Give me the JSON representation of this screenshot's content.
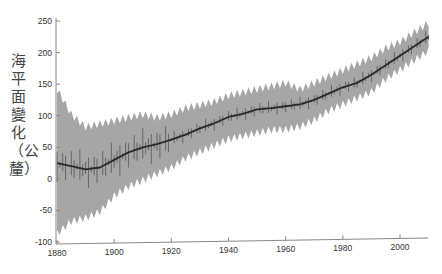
{
  "chart_data": {
    "type": "area",
    "title": "",
    "xlabel": "",
    "ylabel": "海平面變化（公釐）",
    "xlim": [
      1880,
      2012
    ],
    "ylim": [
      -100,
      250
    ],
    "xticks": [
      1880,
      1900,
      1920,
      1940,
      1960,
      1980,
      2000
    ],
    "yticks": [
      -100,
      -50,
      0,
      50,
      100,
      150,
      200,
      250
    ],
    "grid": false,
    "legend": null,
    "x": [
      1880,
      1885,
      1890,
      1895,
      1900,
      1905,
      1910,
      1915,
      1920,
      1925,
      1930,
      1935,
      1940,
      1945,
      1950,
      1955,
      1960,
      1965,
      1970,
      1975,
      1980,
      1985,
      1990,
      1995,
      2000,
      2005,
      2010
    ],
    "series": [
      {
        "name": "smoothed sea level",
        "color": "#2a2a2a",
        "values": [
          25,
          20,
          15,
          18,
          30,
          42,
          50,
          55,
          62,
          70,
          80,
          88,
          98,
          103,
          110,
          112,
          115,
          118,
          125,
          135,
          145,
          152,
          165,
          180,
          195,
          210,
          225
        ]
      },
      {
        "name": "uncertainty upper",
        "color": "#a6a6a6",
        "values": [
          140,
          100,
          80,
          85,
          90,
          95,
          100,
          95,
          100,
          110,
          115,
          120,
          130,
          135,
          140,
          145,
          150,
          140,
          150,
          160,
          170,
          180,
          190,
          205,
          215,
          230,
          245
        ]
      },
      {
        "name": "uncertainty lower",
        "color": "#a6a6a6",
        "values": [
          -85,
          -65,
          -60,
          -50,
          -25,
          -10,
          0,
          10,
          20,
          35,
          45,
          55,
          65,
          70,
          75,
          80,
          80,
          85,
          95,
          110,
          120,
          130,
          140,
          160,
          175,
          190,
          205
        ]
      }
    ]
  },
  "axis": {
    "y_label": "海平面變化（公釐）"
  }
}
